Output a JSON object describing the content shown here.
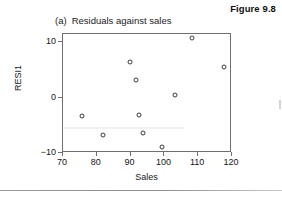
{
  "figure": {
    "number_label": "Figure 9.8",
    "panel_letter": "(a)",
    "panel_title": "Residuals against sales"
  },
  "chart_data": {
    "type": "scatter",
    "xlabel": "Sales",
    "ylabel": "RESI1",
    "xlim": [
      70,
      120
    ],
    "ylim": [
      -10,
      11.5
    ],
    "xticks": [
      70,
      80,
      90,
      100,
      110,
      120
    ],
    "xticklabels": [
      "70",
      "80",
      "90",
      "100",
      "110",
      "120"
    ],
    "yticks": [
      10,
      0,
      -10
    ],
    "yticklabels": [
      "10",
      "0",
      "−10"
    ],
    "grid": false,
    "legend": null,
    "marker": "open-circle",
    "marker_color": "#3a3a3a",
    "points": [
      {
        "x": 75.6,
        "y": -3.3
      },
      {
        "x": 81.9,
        "y": -6.8
      },
      {
        "x": 89.8,
        "y": 6.5
      },
      {
        "x": 91.6,
        "y": 3.1
      },
      {
        "x": 92.5,
        "y": -3.1
      },
      {
        "x": 93.8,
        "y": -6.4
      },
      {
        "x": 99.3,
        "y": -8.9
      },
      {
        "x": 103.1,
        "y": 0.5
      },
      {
        "x": 108.2,
        "y": 10.7
      },
      {
        "x": 117.6,
        "y": 5.5
      }
    ]
  }
}
